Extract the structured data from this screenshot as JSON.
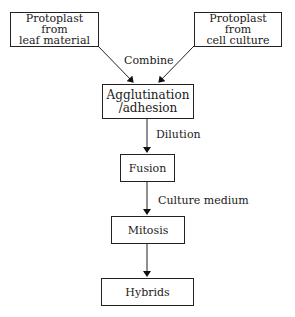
{
  "diagram": {
    "nodes": [
      {
        "id": "leaf",
        "label": "Protoplast\nfrom\nleaf material"
      },
      {
        "id": "cell",
        "label": "Protoplast\nfrom\ncell culture"
      },
      {
        "id": "agglutination",
        "label": "Agglutination\n/adhesion"
      },
      {
        "id": "fusion",
        "label": "Fusion"
      },
      {
        "id": "mitosis",
        "label": "Mitosis"
      },
      {
        "id": "hybrids",
        "label": "Hybrids"
      }
    ],
    "edges": [
      {
        "from": "leaf",
        "to": "agglutination",
        "label": "Combine"
      },
      {
        "from": "cell",
        "to": "agglutination",
        "label": ""
      },
      {
        "from": "agglutination",
        "to": "fusion",
        "label": "Dilution"
      },
      {
        "from": "fusion",
        "to": "mitosis",
        "label": "Culture medium"
      },
      {
        "from": "mitosis",
        "to": "hybrids",
        "label": ""
      }
    ]
  }
}
